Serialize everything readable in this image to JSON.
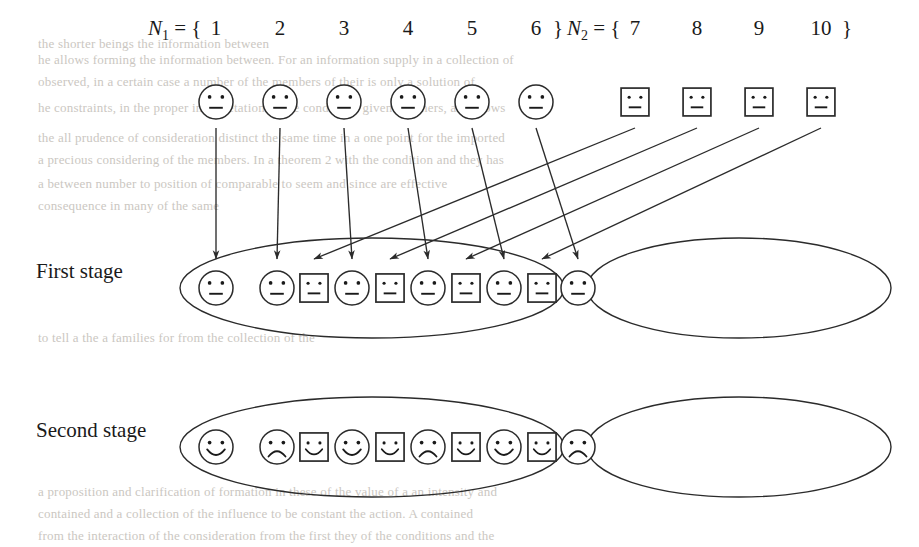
{
  "figure": {
    "sets": {
      "n1": {
        "label": "N₁ = {",
        "close": "}",
        "members": [
          "1",
          "2",
          "3",
          "4",
          "5",
          "6"
        ]
      },
      "n2": {
        "label": "N₂ = {",
        "close": "}",
        "members": [
          "7",
          "8",
          "9",
          "10"
        ]
      }
    },
    "stages": [
      {
        "name": "first-stage",
        "label": "First stage",
        "left_group": {
          "faces": [
            {
              "shape": "circle",
              "mood": "neutral"
            },
            {
              "shape": "circle",
              "mood": "neutral"
            },
            {
              "shape": "square",
              "mood": "neutral"
            },
            {
              "shape": "circle",
              "mood": "neutral"
            },
            {
              "shape": "square",
              "mood": "neutral"
            },
            {
              "shape": "circle",
              "mood": "neutral"
            },
            {
              "shape": "square",
              "mood": "neutral"
            },
            {
              "shape": "circle",
              "mood": "neutral"
            },
            {
              "shape": "square",
              "mood": "neutral"
            },
            {
              "shape": "circle",
              "mood": "neutral"
            }
          ]
        },
        "right_group": {
          "faces": []
        }
      },
      {
        "name": "second-stage",
        "label": "Second stage",
        "left_group": {
          "faces": [
            {
              "shape": "circle",
              "mood": "happy"
            },
            {
              "shape": "circle",
              "mood": "sad"
            },
            {
              "shape": "square",
              "mood": "happy"
            },
            {
              "shape": "circle",
              "mood": "happy"
            },
            {
              "shape": "square",
              "mood": "happy"
            },
            {
              "shape": "circle",
              "mood": "sad"
            },
            {
              "shape": "square",
              "mood": "happy"
            },
            {
              "shape": "circle",
              "mood": "happy"
            },
            {
              "shape": "square",
              "mood": "happy"
            },
            {
              "shape": "circle",
              "mood": "sad"
            }
          ]
        },
        "right_group": {
          "faces": []
        }
      }
    ],
    "top_row": {
      "n1_faces": [
        {
          "shape": "circle",
          "mood": "neutral"
        },
        {
          "shape": "circle",
          "mood": "neutral"
        },
        {
          "shape": "circle",
          "mood": "neutral"
        },
        {
          "shape": "circle",
          "mood": "neutral"
        },
        {
          "shape": "circle",
          "mood": "neutral"
        },
        {
          "shape": "circle",
          "mood": "neutral"
        }
      ],
      "n2_faces": [
        {
          "shape": "square",
          "mood": "neutral"
        },
        {
          "shape": "square",
          "mood": "neutral"
        },
        {
          "shape": "square",
          "mood": "neutral"
        },
        {
          "shape": "square",
          "mood": "neutral"
        }
      ]
    },
    "colors": {
      "ink": "#1a1a1a",
      "line": "#2b2b2b",
      "background": "#ffffff",
      "bleed_text": "#b9b4ad"
    }
  },
  "bleed_text": [
    {
      "text": "the shorter beings the information between",
      "x": 38,
      "y": 36
    },
    {
      "text": "he allows forming the information between. For an information supply in a collection of",
      "x": 38,
      "y": 52
    },
    {
      "text": "observed, in a certain case a number of the members of their is only a solution of",
      "x": 38,
      "y": 74
    },
    {
      "text": "he constraints, in the proper interpretation of the conditions given of others, as follows",
      "x": 38,
      "y": 100
    },
    {
      "text": "the all prudence of consideration distinct the same time in a one point for the imported",
      "x": 38,
      "y": 130
    },
    {
      "text": "a precious considering of the members. In a theorem 2 with the condition and they has",
      "x": 38,
      "y": 152
    },
    {
      "text": "a between number to position of comparable to seem and since  are effective",
      "x": 38,
      "y": 176
    },
    {
      "text": "consequence in many of the same",
      "x": 38,
      "y": 198
    },
    {
      "text": "to tell a the a families for from the collection of the",
      "x": 38,
      "y": 330
    },
    {
      "text": "a proposition and clarification of formation in these of the value of a an intensity and",
      "x": 38,
      "y": 484
    },
    {
      "text": "contained and a collection of the influence to be constant the action. A contained",
      "x": 38,
      "y": 506
    },
    {
      "text": "from the interaction of the consideration from the first they of the conditions and the",
      "x": 38,
      "y": 528
    }
  ]
}
